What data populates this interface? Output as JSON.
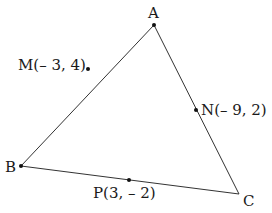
{
  "diagram": {
    "type": "triangle",
    "vertices": {
      "A": {
        "label": "A",
        "x": 154,
        "y": 25
      },
      "B": {
        "label": "B",
        "x": 21,
        "y": 166
      },
      "C": {
        "label": "C",
        "x": 239,
        "y": 194
      }
    },
    "midpoints": {
      "M": {
        "label": "M(– 3, 4)",
        "x": 88,
        "y": 69,
        "side": "AB"
      },
      "N": {
        "label": "N(– 9, 2)",
        "x": 196,
        "y": 110,
        "side": "AC"
      },
      "P": {
        "label": "P(3, – 2)",
        "x": 129,
        "y": 180,
        "side": "BC"
      }
    },
    "line_color": "#333333"
  }
}
